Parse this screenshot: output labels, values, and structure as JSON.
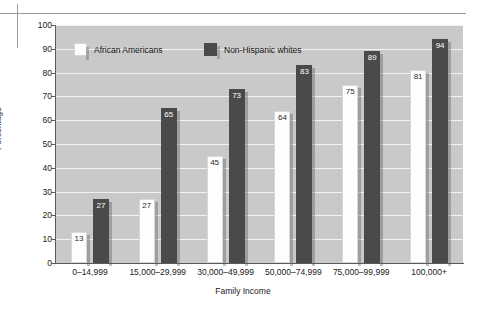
{
  "chart_data": {
    "type": "bar",
    "title": "",
    "xlabel": "Family Income",
    "ylabel": "Percentage",
    "ylim": [
      0,
      100
    ],
    "ytick_step": 10,
    "grid": true,
    "legend_position": "top-inside",
    "categories": [
      "0–14,999",
      "15,000–29,999",
      "30,000–49,999",
      "50,000–74,999",
      "75,000–99,999",
      "100,000+"
    ],
    "yticks": [
      "0",
      "10",
      "20",
      "30",
      "40",
      "50",
      "60",
      "70",
      "80",
      "90",
      "100"
    ],
    "series": [
      {
        "name": "African Americans",
        "color": "#fdfdfd",
        "values": [
          13,
          27,
          45,
          64,
          75,
          81
        ]
      },
      {
        "name": "Non-Hispanic whites",
        "color": "#4a4a4a",
        "values": [
          27,
          65,
          73,
          83,
          89,
          94
        ]
      }
    ]
  },
  "colors": {
    "plot_background": "#c9c9c9",
    "gridline": "#f2f2f2",
    "axis": "#5a5a5a",
    "page_background": "#ffffff",
    "rule": "#9a9a9a"
  }
}
